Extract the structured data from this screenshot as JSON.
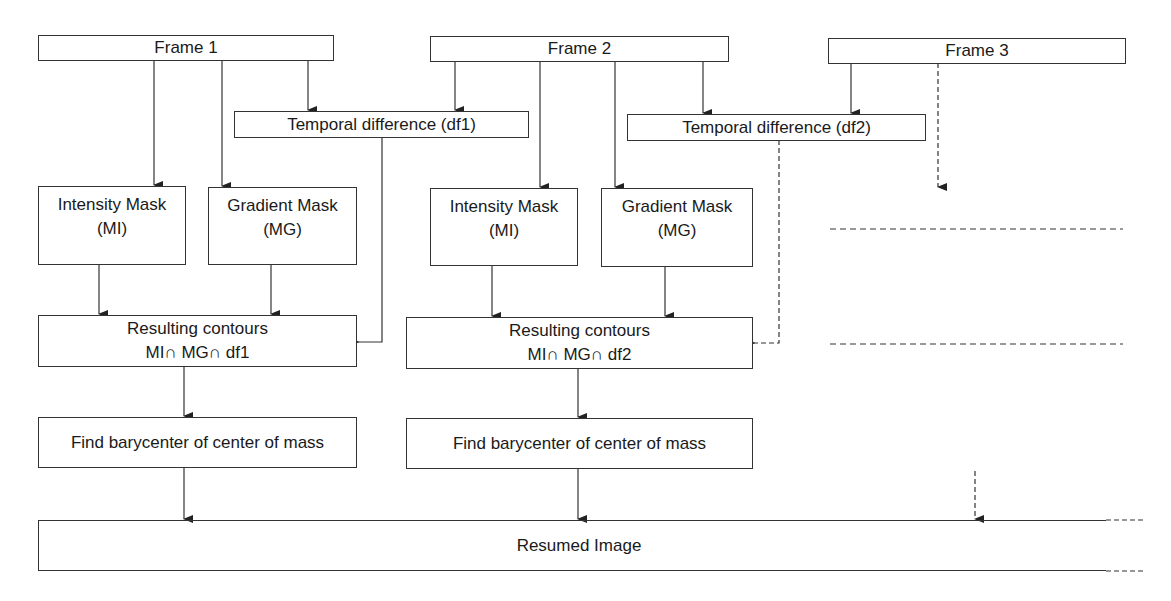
{
  "diagram": {
    "frames": [
      {
        "id": "frame1",
        "label": "Frame 1"
      },
      {
        "id": "frame2",
        "label": "Frame 2"
      },
      {
        "id": "frame3",
        "label": "Frame 3"
      }
    ],
    "temporal_differences": [
      {
        "id": "df1",
        "label": "Temporal difference (df1)"
      },
      {
        "id": "df2",
        "label": "Temporal difference (df2)"
      }
    ],
    "pipelines": [
      {
        "intensity_mask": {
          "line1": "Intensity Mask",
          "line2": "(MI)"
        },
        "gradient_mask": {
          "line1": "Gradient Mask",
          "line2": "(MG)"
        },
        "resulting_contours": {
          "line1": "Resulting contours",
          "line2": "MI∩ MG∩ df1"
        },
        "barycenter": {
          "label": "Find barycenter of center of mass"
        }
      },
      {
        "intensity_mask": {
          "line1": "Intensity Mask",
          "line2": "(MI)"
        },
        "gradient_mask": {
          "line1": "Gradient Mask",
          "line2": "(MG)"
        },
        "resulting_contours": {
          "line1": "Resulting contours",
          "line2": "MI∩ MG∩ df2"
        },
        "barycenter": {
          "label": "Find barycenter of center of mass"
        }
      }
    ],
    "output": {
      "label": "Resumed Image"
    },
    "colors": {
      "line": "#333333",
      "text": "#1a1a1a",
      "background": "#ffffff"
    }
  }
}
